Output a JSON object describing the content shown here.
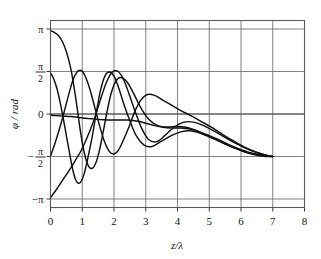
{
  "chart_data": {
    "type": "line",
    "title": "",
    "subtitle": "",
    "xlabel": "z/λ",
    "ylabel": "φ / rad",
    "xlim": [
      0,
      8
    ],
    "ylim": [
      -3.4557519,
      3.4557519
    ],
    "grid": true,
    "legend_position": "none",
    "x_ticks": [
      0,
      1,
      2,
      3,
      4,
      5,
      6,
      7,
      8
    ],
    "x_tick_labels": [
      "0",
      "1",
      "2",
      "3",
      "4",
      "5",
      "6",
      "7",
      "8"
    ],
    "y_ticks": [
      3.14159265,
      1.57079633,
      0,
      -1.57079633,
      -3.14159265
    ],
    "y_tick_labels": [
      "π",
      "π/2",
      "0",
      "-π/2",
      "-π"
    ],
    "y_tick_label_parts": [
      {
        "sign": "",
        "num": "π",
        "den": ""
      },
      {
        "sign": "",
        "num": "π",
        "den": "2"
      },
      {
        "sign": "",
        "num": "0",
        "den": ""
      },
      {
        "sign": "−",
        "num": "π",
        "den": "2"
      },
      {
        "sign": "−",
        "num": "π",
        "den": ""
      }
    ],
    "line_color": "#111111",
    "grid_color": "#6b6b6e",
    "background_color": "#ffffff",
    "series": [
      {
        "name": "curve-1",
        "x": [
          0.0,
          0.12,
          0.25,
          0.38,
          0.5,
          0.62,
          0.7,
          0.78,
          0.86,
          0.95,
          1.05,
          1.15,
          1.25,
          1.35,
          1.45,
          1.55,
          1.65,
          1.75,
          1.9,
          2.05,
          2.2,
          2.4,
          2.6,
          2.85,
          3.1,
          3.4,
          3.7,
          4.0,
          4.3,
          4.6,
          4.9,
          5.2,
          5.5,
          5.8,
          6.1,
          6.4,
          6.7,
          7.0
        ],
        "y": [
          3.07,
          3.02,
          2.9,
          2.66,
          2.3,
          1.78,
          1.3,
          0.7,
          0.05,
          -0.7,
          -1.35,
          -1.8,
          -2.0,
          -1.98,
          -1.74,
          -1.3,
          -0.72,
          -0.1,
          0.72,
          1.2,
          1.35,
          1.2,
          0.8,
          0.22,
          -0.2,
          -0.44,
          -0.48,
          -0.46,
          -0.5,
          -0.62,
          -0.78,
          -0.94,
          -1.1,
          -1.26,
          -1.4,
          -1.5,
          -1.56,
          -1.57
        ]
      },
      {
        "name": "curve-2",
        "x": [
          0.0,
          0.1,
          0.2,
          0.3,
          0.4,
          0.5,
          0.6,
          0.7,
          0.8,
          0.92,
          1.05,
          1.18,
          1.32,
          1.45,
          1.58,
          1.72,
          1.85,
          2.0,
          2.15,
          2.3,
          2.5,
          2.7,
          2.95,
          3.2,
          3.5,
          3.8,
          4.1,
          4.4,
          4.7,
          5.0,
          5.3,
          5.6,
          5.9,
          6.2,
          6.5,
          6.8,
          7.0
        ],
        "y": [
          1.52,
          1.3,
          0.95,
          0.45,
          -0.15,
          -0.8,
          -1.45,
          -2.05,
          -2.45,
          -2.55,
          -2.25,
          -1.6,
          -0.8,
          0.1,
          0.9,
          1.42,
          1.55,
          1.4,
          0.96,
          0.4,
          -0.25,
          -0.8,
          -1.15,
          -1.2,
          -1.0,
          -0.8,
          -0.66,
          -0.62,
          -0.7,
          -0.84,
          -1.0,
          -1.16,
          -1.3,
          -1.42,
          -1.5,
          -1.55,
          -1.57
        ]
      },
      {
        "name": "curve-3",
        "x": [
          0.0,
          0.15,
          0.3,
          0.45,
          0.6,
          0.72,
          0.85,
          0.98,
          1.1,
          1.22,
          1.35,
          1.5,
          1.65,
          1.8,
          1.95,
          2.1,
          2.25,
          2.42,
          2.6,
          2.8,
          3.0,
          3.25,
          3.5,
          3.8,
          4.1,
          4.4,
          4.7,
          5.0,
          5.3,
          5.6,
          5.9,
          6.2,
          6.5,
          6.8,
          7.0
        ],
        "y": [
          -0.04,
          -0.06,
          -0.07,
          -0.08,
          -0.09,
          -0.1,
          -0.12,
          -0.14,
          -0.16,
          -0.17,
          -0.18,
          -0.2,
          -0.21,
          -0.22,
          -0.22,
          -0.22,
          -0.22,
          -0.22,
          -0.24,
          -0.28,
          -0.34,
          -0.42,
          -0.48,
          -0.52,
          -0.52,
          -0.56,
          -0.66,
          -0.8,
          -0.95,
          -1.12,
          -1.27,
          -1.4,
          -1.49,
          -1.55,
          -1.57
        ]
      },
      {
        "name": "curve-4",
        "x": [
          0.0,
          0.15,
          0.32,
          0.48,
          0.62,
          0.75,
          0.88,
          1.0,
          1.12,
          1.25,
          1.4,
          1.55,
          1.7,
          1.85,
          2.0,
          2.15,
          2.3,
          2.48,
          2.65,
          2.85,
          3.05,
          3.3,
          3.55,
          3.85,
          4.15,
          4.45,
          4.75,
          5.05,
          5.35,
          5.65,
          5.95,
          6.25,
          6.55,
          6.85,
          7.0
        ],
        "y": [
          -1.55,
          -1.05,
          -0.4,
          0.3,
          0.92,
          1.38,
          1.6,
          1.58,
          1.32,
          0.88,
          0.22,
          -0.45,
          -1.02,
          -1.38,
          -1.48,
          -1.32,
          -0.95,
          -0.45,
          0.08,
          0.52,
          0.72,
          0.68,
          0.5,
          0.3,
          0.1,
          -0.08,
          -0.28,
          -0.48,
          -0.7,
          -0.92,
          -1.12,
          -1.3,
          -1.44,
          -1.54,
          -1.57
        ]
      },
      {
        "name": "curve-5",
        "x": [
          0.0,
          0.18,
          0.38,
          0.58,
          0.78,
          0.98,
          1.15,
          1.32,
          1.48,
          1.62,
          1.78,
          1.95,
          2.12,
          2.3,
          2.48,
          2.68,
          2.88,
          3.1,
          3.35,
          3.6,
          3.9,
          4.2,
          4.5,
          4.8,
          5.1,
          5.4,
          5.7,
          6.0,
          6.3,
          6.6,
          6.85,
          7.0
        ],
        "y": [
          -3.1,
          -2.8,
          -2.45,
          -2.1,
          -1.72,
          -1.32,
          -0.88,
          -0.38,
          0.18,
          0.7,
          1.22,
          1.55,
          1.58,
          1.28,
          0.72,
          0.05,
          -0.55,
          -0.95,
          -1.02,
          -0.8,
          -0.48,
          -0.3,
          -0.3,
          -0.42,
          -0.6,
          -0.8,
          -1.0,
          -1.18,
          -1.34,
          -1.46,
          -1.54,
          -1.57
        ]
      }
    ]
  },
  "figure": {
    "xlabel": "z/λ",
    "ylabel_phi": "φ",
    "ylabel_sep": "/",
    "ylabel_unit": "rad"
  }
}
